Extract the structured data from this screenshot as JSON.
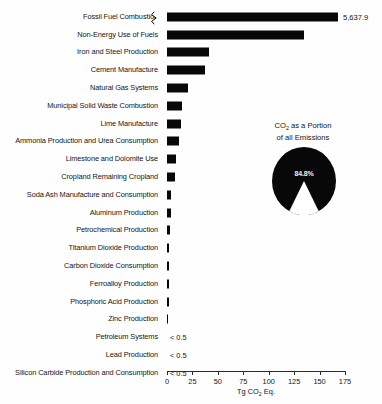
{
  "chart_data": {
    "type": "bar",
    "title": "",
    "xlabel": "Tg CO2 Eq.",
    "ylabel": "",
    "xlim": [
      0,
      175
    ],
    "xticks": [
      0,
      25,
      50,
      75,
      100,
      125,
      150,
      175
    ],
    "grid": false,
    "legend": "none",
    "orientation": "horizontal",
    "note": "Top bar is axis-broken; its true value 5,637.9 is labeled at the end of the bar.",
    "categories": [
      "Fossil Fuel Combustion",
      "Non-Energy Use of Fuels",
      "Iron and Steel Production",
      "Cement Manufacture",
      "Natural Gas Systems",
      "Municipal Solid Waste Combustion",
      "Lime Manufacture",
      "Ammonia Production and Urea Consumption",
      "Limestone and Dolomite Use",
      "Cropland Remaining Cropland",
      "Soda Ash Manufacture and Consumption",
      "Aluminum Production",
      "Petrochemical Production",
      "Titanium Dioxide Production",
      "Carbon Dioxide Consumption",
      "Ferroalloy Production",
      "Phosphoric Acid Production",
      "Zinc Production",
      "Petroleum Systems",
      "Lead Production",
      "Silicon Carbide Production and Consumption"
    ],
    "values": [
      5637.9,
      135,
      41,
      37,
      21,
      15,
      14,
      12,
      9,
      8,
      4,
      4,
      3,
      2,
      2,
      1.5,
      1.5,
      1,
      0.4,
      0.4,
      0.4
    ],
    "value_labels": [
      "5,637.9",
      "",
      "",
      "",
      "",
      "",
      "",
      "",
      "",
      "",
      "",
      "",
      "",
      "",
      "",
      "",
      "",
      "",
      "< 0.5",
      "< 0.5",
      "< 0.5"
    ],
    "broken_axis_index": 0,
    "bar_color": "#080808",
    "axis_color": "#2c2c2c"
  },
  "pie": {
    "type": "pie",
    "title_line1": "CO2 as a Portion",
    "title_line2": "of all Emissions",
    "slices": [
      {
        "label": "CO2",
        "value": 84.8,
        "display": "84.8%",
        "color": "#080808"
      },
      {
        "label": "Other",
        "value": 15.2,
        "display": "",
        "color": "#ffffff"
      }
    ]
  },
  "axis": {
    "tick_labels": [
      "0",
      "25",
      "50",
      "75",
      "100",
      "125",
      "150",
      "175"
    ],
    "title_prefix": "Tg CO",
    "title_sub": "2",
    "title_suffix": " Eq."
  }
}
